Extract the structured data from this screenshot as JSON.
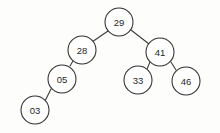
{
  "figure": {
    "kind": "binary-search-tree-diagram",
    "background_color": "#fdfdfc",
    "node_fill_color": "#ffffff",
    "node_stroke_color": "#2e2e2e",
    "edge_stroke_color": "#3a3a3a",
    "label_color": "#1f1f1f",
    "width": 220,
    "height": 133
  },
  "tree": {
    "root_value": "29",
    "nodes": [
      {
        "id": "n29",
        "label": "29",
        "cx": 119,
        "cy": 22,
        "r": 14,
        "depth": 0,
        "side": "root"
      },
      {
        "id": "n28",
        "label": "28",
        "cx": 82,
        "cy": 50,
        "r": 14,
        "depth": 1,
        "side": "left"
      },
      {
        "id": "n41",
        "label": "41",
        "cx": 160,
        "cy": 52,
        "r": 14,
        "depth": 1,
        "side": "right"
      },
      {
        "id": "n05",
        "label": "05",
        "cx": 62,
        "cy": 79,
        "r": 14,
        "depth": 2,
        "side": "left"
      },
      {
        "id": "n33",
        "label": "33",
        "cx": 138,
        "cy": 80,
        "r": 14,
        "depth": 2,
        "side": "left"
      },
      {
        "id": "n46",
        "label": "46",
        "cx": 186,
        "cy": 81,
        "r": 14,
        "depth": 2,
        "side": "right"
      },
      {
        "id": "n03",
        "label": "03",
        "cx": 35,
        "cy": 110,
        "r": 14,
        "depth": 3,
        "side": "left"
      }
    ],
    "edges": [
      {
        "id": "e-29-28",
        "from": "n29",
        "to": "n28",
        "x1": 108,
        "y1": 31,
        "x2": 92,
        "y2": 42
      },
      {
        "id": "e-29-41",
        "from": "n29",
        "to": "n41",
        "x1": 131,
        "y1": 30,
        "x2": 149,
        "y2": 44
      },
      {
        "id": "e-28-05",
        "from": "n28",
        "to": "n05",
        "x1": 73,
        "y1": 61,
        "x2": 70,
        "y2": 66
      },
      {
        "id": "e-05-03",
        "from": "n05",
        "to": "n03",
        "x1": 51,
        "y1": 89,
        "x2": 45,
        "y2": 101
      },
      {
        "id": "e-41-33",
        "from": "n41",
        "to": "n33",
        "x1": 150,
        "y1": 62,
        "x2": 147,
        "y2": 69
      },
      {
        "id": "e-41-46",
        "from": "n41",
        "to": "n46",
        "x1": 171,
        "y1": 62,
        "x2": 176,
        "y2": 70
      }
    ]
  }
}
